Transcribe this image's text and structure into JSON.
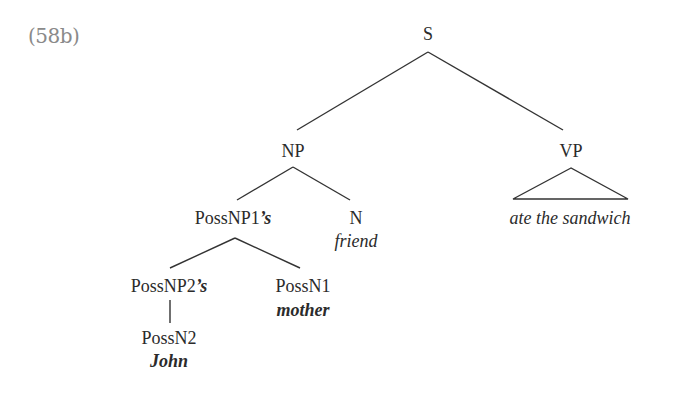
{
  "example_label": "(58b)",
  "tree": {
    "nodes": {
      "S": {
        "label": "S"
      },
      "NP": {
        "label": "NP"
      },
      "VP": {
        "label": "VP"
      },
      "VP_terminal": {
        "text": "ate the sandwich"
      },
      "PossNP1": {
        "label": "PossNP1",
        "suffix": "’s"
      },
      "N": {
        "label": "N",
        "word": "friend"
      },
      "PossNP2": {
        "label": "PossNP2",
        "suffix": "’s"
      },
      "PossN1": {
        "label": "PossN1",
        "word": "mother"
      },
      "PossN2": {
        "label": "PossN2",
        "word": "John"
      }
    },
    "edges": [
      [
        "S",
        "NP"
      ],
      [
        "S",
        "VP"
      ],
      [
        "NP",
        "PossNP1"
      ],
      [
        "NP",
        "N"
      ],
      [
        "PossNP1",
        "PossNP2"
      ],
      [
        "PossNP1",
        "PossN1"
      ],
      [
        "PossNP2",
        "PossN2"
      ]
    ],
    "triangles": [
      "VP"
    ]
  }
}
